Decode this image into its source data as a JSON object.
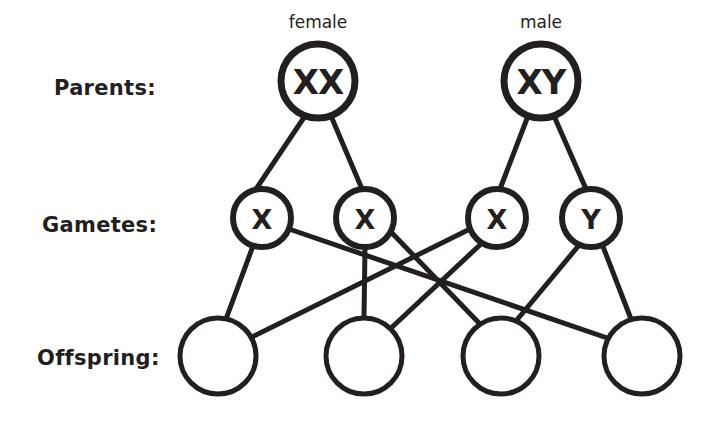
{
  "diagram": {
    "stroke_color": "#231f20",
    "background_color": "#ffffff",
    "rows": [
      {
        "key": "parents",
        "label": "Parents:",
        "label_x": 54,
        "label_y": 95
      },
      {
        "key": "gametes",
        "label": "Gametes:",
        "label_x": 42,
        "label_y": 232
      },
      {
        "key": "offspring",
        "label": "Offspring:",
        "label_x": 37,
        "label_y": 365
      }
    ],
    "sex_labels": [
      {
        "name": "female-label",
        "text": "female",
        "x": 318,
        "y": 28
      },
      {
        "name": "male-label",
        "text": "male",
        "x": 541,
        "y": 28
      }
    ],
    "parents": [
      {
        "id": "parent-female",
        "genotype": "XX",
        "cx": 318,
        "cy": 81,
        "r": 37
      },
      {
        "id": "parent-male",
        "genotype": "XY",
        "cx": 541,
        "cy": 81,
        "r": 37
      }
    ],
    "gametes": [
      {
        "id": "gamete-1",
        "allele": "X",
        "cx": 262,
        "cy": 218,
        "r": 29,
        "parent": "parent-female"
      },
      {
        "id": "gamete-2",
        "allele": "X",
        "cx": 365,
        "cy": 218,
        "r": 29,
        "parent": "parent-female"
      },
      {
        "id": "gamete-3",
        "allele": "X",
        "cx": 497,
        "cy": 218,
        "r": 29,
        "parent": "parent-male"
      },
      {
        "id": "gamete-4",
        "allele": "Y",
        "cx": 591,
        "cy": 218,
        "r": 29,
        "parent": "parent-male"
      }
    ],
    "offspring": [
      {
        "id": "offspring-1",
        "genotype": "",
        "cx": 218,
        "cy": 356,
        "r": 38
      },
      {
        "id": "offspring-2",
        "genotype": "",
        "cx": 364,
        "cy": 356,
        "r": 38
      },
      {
        "id": "offspring-3",
        "genotype": "",
        "cx": 501,
        "cy": 356,
        "r": 38
      },
      {
        "id": "offspring-4",
        "genotype": "",
        "cx": 642,
        "cy": 356,
        "r": 38
      }
    ],
    "links": [
      {
        "name": "link-parent-female-gamete-1",
        "from": "parent-female",
        "to": "gamete-1",
        "x1": 305,
        "y1": 116,
        "x2": 256,
        "y2": 189
      },
      {
        "name": "link-parent-female-gamete-2",
        "from": "parent-female",
        "to": "gamete-2",
        "x1": 331,
        "y1": 116,
        "x2": 362,
        "y2": 189
      },
      {
        "name": "link-parent-male-gamete-3",
        "from": "parent-male",
        "to": "gamete-3",
        "x1": 528,
        "y1": 116,
        "x2": 500,
        "y2": 189
      },
      {
        "name": "link-parent-male-gamete-4",
        "from": "parent-male",
        "to": "gamete-4",
        "x1": 554,
        "y1": 116,
        "x2": 586,
        "y2": 189
      },
      {
        "name": "link-gamete-1-offspring-1",
        "from": "gamete-1",
        "to": "offspring-1",
        "x1": 253,
        "y1": 246,
        "x2": 226,
        "y2": 319
      },
      {
        "name": "link-gamete-1-offspring-4",
        "from": "gamete-1",
        "to": "offspring-4",
        "x1": 289,
        "y1": 229,
        "x2": 616,
        "y2": 341
      },
      {
        "name": "link-gamete-2-offspring-2",
        "from": "gamete-2",
        "to": "offspring-2",
        "x1": 365,
        "y1": 247,
        "x2": 364,
        "y2": 318
      },
      {
        "name": "link-gamete-2-offspring-3",
        "from": "gamete-2",
        "to": "offspring-3",
        "x1": 390,
        "y1": 231,
        "x2": 480,
        "y2": 324
      },
      {
        "name": "link-gamete-3-offspring-1",
        "from": "gamete-3",
        "to": "offspring-1",
        "x1": 470,
        "y1": 229,
        "x2": 244,
        "y2": 341
      },
      {
        "name": "link-gamete-3-offspring-2",
        "from": "gamete-3",
        "to": "offspring-2",
        "x1": 482,
        "y1": 243,
        "x2": 389,
        "y2": 330
      },
      {
        "name": "link-gamete-4-offspring-3",
        "from": "gamete-4",
        "to": "offspring-3",
        "x1": 580,
        "y1": 244,
        "x2": 516,
        "y2": 321
      },
      {
        "name": "link-gamete-4-offspring-4",
        "from": "gamete-4",
        "to": "offspring-4",
        "x1": 602,
        "y1": 244,
        "x2": 631,
        "y2": 319
      }
    ]
  }
}
